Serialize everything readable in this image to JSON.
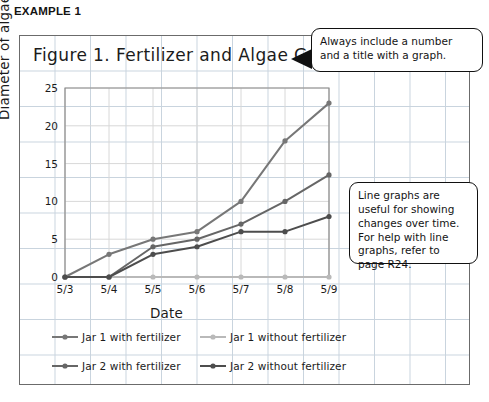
{
  "example_label": "EXAMPLE 1",
  "callouts": {
    "title_note": "Always include a number and a title with a graph.",
    "info_note": "Line graphs are useful for showing changes over time. For help with line graphs, refer to page R24."
  },
  "chart_data": {
    "type": "line",
    "title": "Figure 1. Fertilizer and Algae Growth",
    "xlabel": "Date",
    "ylabel": "Diameter of algae (mm)",
    "categories": [
      "5/3",
      "5/4",
      "5/5",
      "5/6",
      "5/7",
      "5/8",
      "5/9"
    ],
    "ylim": [
      0,
      25
    ],
    "yticks": [
      0,
      5,
      10,
      15,
      20,
      25
    ],
    "grid": true,
    "legend_position": "bottom",
    "series": [
      {
        "name": "Jar 1 with fertilizer",
        "color": "#777777",
        "values": [
          0,
          3,
          5,
          6,
          10,
          18,
          23
        ]
      },
      {
        "name": "Jar 1 without fertilizer",
        "color": "#b9b9b9",
        "values": [
          0,
          0,
          0,
          0,
          0,
          0,
          0
        ]
      },
      {
        "name": "Jar 2 with fertilizer",
        "color": "#666666",
        "values": [
          0,
          0,
          4,
          5,
          7,
          10,
          13.5
        ]
      },
      {
        "name": "Jar 2 without fertilizer",
        "color": "#4d4d4d",
        "values": [
          0,
          0,
          3,
          4,
          6,
          6,
          8
        ]
      }
    ]
  }
}
